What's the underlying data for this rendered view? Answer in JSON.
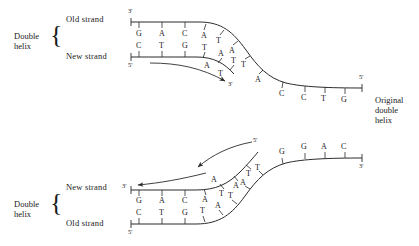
{
  "figure": {
    "type": "diagram",
    "line_color": "#2b2b2b",
    "text_color": "#1a1a1a",
    "background": "#ffffff"
  },
  "top_panel": {
    "group_label_line1": "Double",
    "group_label_line2": "helix",
    "brace": "{",
    "upper_strand_label": "Old strand",
    "lower_strand_label": "New strand",
    "upper_strand_start_prime": "3'",
    "lower_strand_start_prime": "5'",
    "new_strand_end_prime": "3'",
    "template_end_prime": "5'",
    "old_strand_bases": [
      "G",
      "A",
      "C",
      "A",
      "T",
      "A",
      "T",
      "A",
      "C",
      "C",
      "T",
      "G"
    ],
    "new_strand_bases": [
      "C",
      "T",
      "G",
      "T",
      "A",
      "T",
      "A",
      "T"
    ],
    "arrow_direction": "right-down"
  },
  "bottom_panel": {
    "group_label_line1": "Double",
    "group_label_line2": "helix",
    "brace": "{",
    "upper_strand_label": "New strand",
    "lower_strand_label": "Old strand",
    "upper_strand_start_prime": "3'",
    "lower_strand_start_prime": "5'",
    "template_start_prime": "5'",
    "template_end_prime": "3'",
    "new_strand_bases": [
      "G",
      "A",
      "C",
      "A",
      "T",
      "A",
      "T",
      "A"
    ],
    "old_strand_bases": [
      "C",
      "T",
      "G",
      "T",
      "A",
      "T",
      "A",
      "T",
      "G",
      "G",
      "A",
      "C"
    ],
    "arrow_direction": "left"
  },
  "right_label": {
    "line1": "Original",
    "line2": "double",
    "line3": "helix"
  }
}
